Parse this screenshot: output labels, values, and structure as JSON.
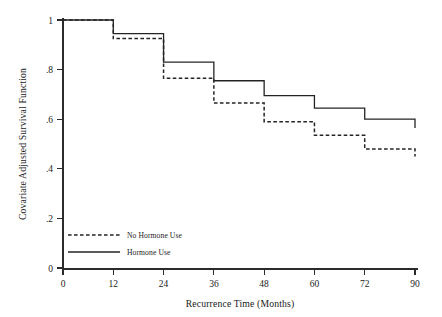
{
  "chart_data": {
    "type": "line",
    "title": "",
    "xlabel": "Recurrence Time (Months)",
    "ylabel": "Covariate Adjusted Survival Function",
    "x_tick_labels": [
      "0",
      "12",
      "24",
      "36",
      "48",
      "60",
      "72",
      "90"
    ],
    "x_tick_values": [
      0,
      12,
      24,
      36,
      48,
      60,
      72,
      90
    ],
    "y_tick_labels": [
      "0",
      ".2",
      ".4",
      ".6",
      ".8",
      "1"
    ],
    "y_tick_values": [
      0,
      0.2,
      0.4,
      0.6,
      0.8,
      1
    ],
    "xlim": [
      0,
      90
    ],
    "ylim": [
      0,
      1
    ],
    "grid": false,
    "step_style": "post",
    "legend_position": "lower-left-inside",
    "series": [
      {
        "name": "No Hormone Use",
        "style": "dashed",
        "color": "#242424",
        "x": [
          0,
          12,
          24,
          36,
          48,
          60,
          72,
          90
        ],
        "values": [
          1.0,
          0.925,
          0.765,
          0.665,
          0.59,
          0.535,
          0.48,
          0.45
        ]
      },
      {
        "name": "Hormone Use",
        "style": "solid",
        "color": "#242424",
        "x": [
          0,
          12,
          24,
          36,
          48,
          60,
          72,
          90
        ],
        "values": [
          1.0,
          0.945,
          0.83,
          0.755,
          0.695,
          0.645,
          0.6,
          0.565
        ]
      }
    ]
  },
  "legend": {
    "entries": [
      {
        "label": "No Hormone Use",
        "style": "dashed"
      },
      {
        "label": "Hormone Use",
        "style": "solid"
      }
    ]
  },
  "axes": {
    "x_title": "Recurrence Time (Months)",
    "y_title": "Covariate Adjusted Survival Function"
  }
}
